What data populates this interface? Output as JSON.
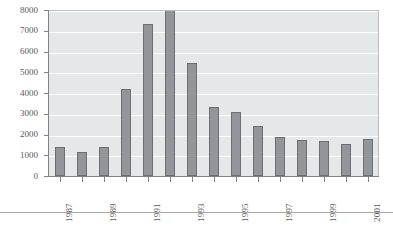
{
  "chart_data": {
    "type": "bar",
    "title": "",
    "subtitle": "",
    "xlabel": "",
    "ylabel": "",
    "categories": [
      "1987",
      "1988",
      "1989",
      "1990",
      "1991",
      "1992",
      "1993",
      "1994",
      "1995",
      "1996",
      "1997",
      "1998",
      "1999",
      "2000",
      "2001"
    ],
    "values": [
      1400,
      1150,
      1400,
      4200,
      7350,
      8000,
      5430,
      3350,
      3100,
      2420,
      1890,
      1745,
      1700,
      1550,
      1790
    ],
    "ylim": [
      0,
      8000
    ],
    "y_ticks": [
      0,
      1000,
      2000,
      3000,
      4000,
      5000,
      6000,
      7000,
      8000
    ],
    "y_tick_labels": [
      "0",
      "1000",
      "2000",
      "3000",
      "4000",
      "5000",
      "6000",
      "7000",
      "8000"
    ],
    "x_tick_labels": [
      "1987",
      "1989",
      "1991",
      "1993",
      "1995",
      "1997",
      "1999",
      "2001"
    ],
    "x_labeled_categories": [
      "1987",
      "1989",
      "1991",
      "1993",
      "1995",
      "1997",
      "1999",
      "2001"
    ],
    "grid": "horizontal",
    "legend": "none",
    "series": [
      {
        "name": "",
        "values": [
          1400,
          1150,
          1400,
          4200,
          7350,
          8000,
          5430,
          3350,
          3100,
          2420,
          1890,
          1745,
          1700,
          1550,
          1790
        ]
      }
    ],
    "colors": {
      "bar_fill": "#939598",
      "bar_border": "#6d6e71",
      "plot_background": "#e6e7e8",
      "gridline": "#ffffff",
      "axis": "#808285",
      "tick_text": "#58595b",
      "page_background": "#ffffff",
      "bottom_rule": "#a7a9ac"
    }
  }
}
